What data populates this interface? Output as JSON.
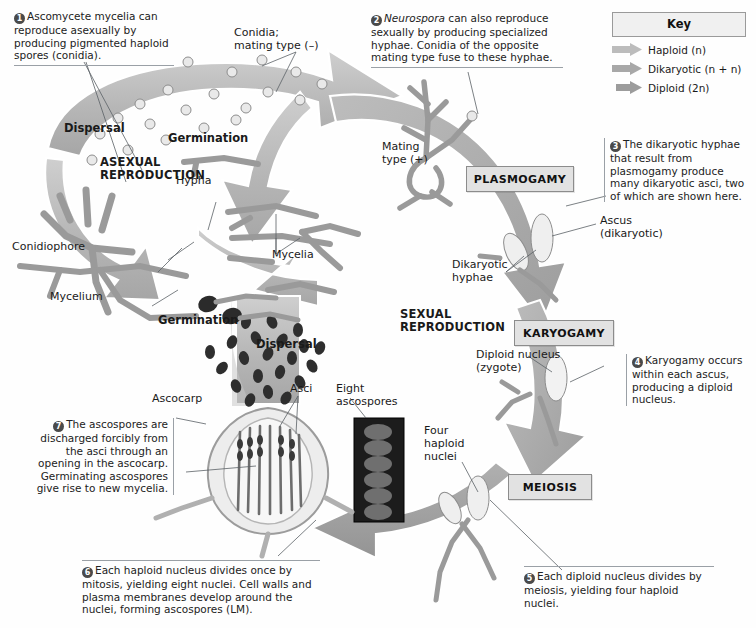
{
  "diagram": {
    "phases": {
      "asexual": "ASEXUAL\nREPRODUCTION",
      "sexual": "SEXUAL\nREPRODUCTION"
    },
    "stage_boxes": [
      {
        "id": "plasmogamy",
        "label": "PLASMOGAMY"
      },
      {
        "id": "karyogamy",
        "label": "KARYOGAMY"
      },
      {
        "id": "meiosis",
        "label": "MEIOSIS"
      }
    ],
    "steps": [
      {
        "n": "1",
        "text": "Ascomycete mycelia can reproduce asexually by producing pigmented haploid spores (conidia)."
      },
      {
        "n": "2",
        "text": "Neurospora can also reproduce sexually by producing specialized hyphae. Conidia of the opposite mating type fuse to these hyphae.",
        "italic_lead": "Neurospora"
      },
      {
        "n": "3",
        "text": "The dikaryotic hyphae that result from plasmogamy produce many dikaryotic asci, two of which are shown here."
      },
      {
        "n": "4",
        "text": "Karyogamy occurs within each ascus, producing a diploid nucleus."
      },
      {
        "n": "5",
        "text": "Each diploid nucleus divides by meiosis, yielding four haploid nuclei."
      },
      {
        "n": "6",
        "text": "Each haploid nucleus divides once by mitosis, yielding eight nuclei. Cell walls and plasma membranes develop around the nuclei, forming ascospores (LM)."
      },
      {
        "n": "7",
        "text": "The ascospores are discharged forcibly from the asci through an opening in the ascocarp. Germinating ascospores give rise to new mycelia."
      }
    ],
    "labels": {
      "conidia_mating_minus": "Conidia;\nmating type (–)",
      "dispersal_top": "Dispersal",
      "germination_top": "Germination",
      "hypha": "Hypha",
      "conidiophore": "Conidiophore",
      "mycelium": "Mycelium",
      "mycelia": "Mycelia",
      "mating_type_plus": "Mating\ntype (+)",
      "ascus_dikaryotic": "Ascus\n(dikaryotic)",
      "dikaryotic_hyphae": "Dikaryotic\nhyphae",
      "diploid_nucleus": "Diploid nucleus\n(zygote)",
      "germination_bottom": "Germination",
      "dispersal_bottom": "Dispersal",
      "ascocarp": "Ascocarp",
      "asci": "Asci",
      "eight_ascospores": "Eight\nascospores",
      "four_haploid_nuclei": "Four\nhaploid\nnuclei"
    }
  },
  "key": {
    "title": "Key",
    "entries": [
      {
        "label": "Haploid (n)",
        "color": "#b9b9b9"
      },
      {
        "label": "Dikaryotic (n + n)",
        "color": "#a8a8a8"
      },
      {
        "label": "Diploid (2n)",
        "color": "#9e9e9e"
      }
    ]
  },
  "colors": {
    "haploid": "#b9b9b9",
    "dikaryotic": "#a8a8a8",
    "diploid": "#9e9e9e",
    "leader": "#5b6166",
    "text": "#1a1a1a",
    "box_fill": "#e2e2e2",
    "box_border": "#8c8c8c"
  }
}
